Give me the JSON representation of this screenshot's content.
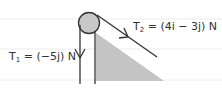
{
  "diagram": {
    "type": "pulley-incline",
    "labels": {
      "t1": {
        "symbol": "T",
        "sub": "1",
        "rest": " = (−5j) N"
      },
      "t2": {
        "symbol": "T",
        "sub": "2",
        "rest": " = (4i − 3j) N"
      }
    },
    "colors": {
      "line": "#333333",
      "pulley_fill": "#c8c8c8",
      "wedge_fill": "#c4c4c4",
      "guide_lines": "#ececec"
    }
  }
}
